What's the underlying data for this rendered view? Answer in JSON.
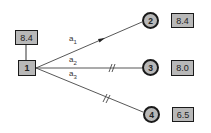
{
  "diagram": {
    "source_node": {
      "id": "1",
      "value": "8.4"
    },
    "target_nodes": [
      {
        "id": "2",
        "value": "8.4",
        "edge_label": "a",
        "edge_sub": "1",
        "edge_marker": "arrow"
      },
      {
        "id": "3",
        "value": "8.0",
        "edge_label": "a",
        "edge_sub": "2",
        "edge_marker": "double-slash"
      },
      {
        "id": "4",
        "value": "6.5",
        "edge_label": "a",
        "edge_sub": "3",
        "edge_marker": "double-slash"
      }
    ],
    "colors": {
      "node_fill": "#b8b8b8",
      "stroke": "#1a1a1a",
      "edge": "#444444"
    }
  }
}
